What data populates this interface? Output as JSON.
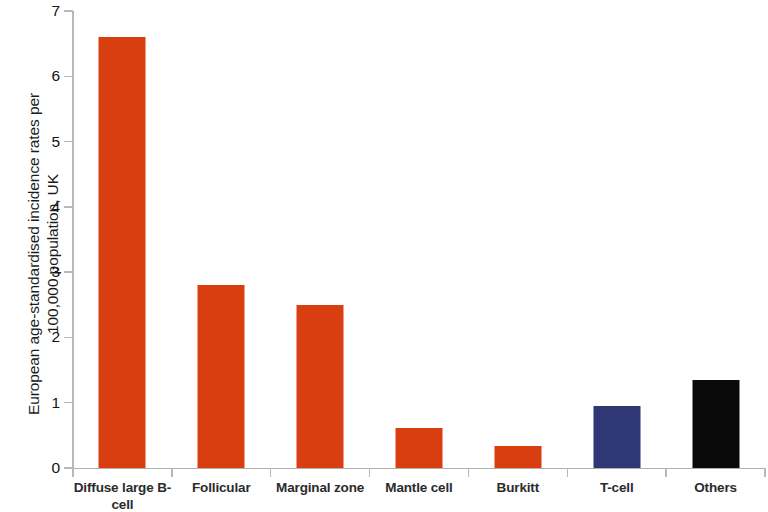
{
  "chart_data": {
    "type": "bar",
    "title": "",
    "subtitle": "",
    "xlabel": "",
    "ylabel": "European age-standardised incidence rates per 100,000 population, UK",
    "ylabel_lines": [
      "European age-standardised incidence rates per",
      "100,000 population, UK"
    ],
    "categories": [
      "Diffuse large B-cell",
      "Follicular",
      "Marginal zone",
      "Mantle cell",
      "Burkitt",
      "T-cell",
      "Others"
    ],
    "category_label_lines": [
      [
        "Diffuse large B-",
        "cell"
      ],
      [
        "Follicular"
      ],
      [
        "Marginal zone"
      ],
      [
        "Mantle cell"
      ],
      [
        "Burkitt"
      ],
      [
        "T-cell"
      ],
      [
        "Others"
      ]
    ],
    "values": [
      6.6,
      2.8,
      2.5,
      0.62,
      0.33,
      0.95,
      1.35
    ],
    "bar_colors": [
      "#d93e11",
      "#d93e11",
      "#d93e11",
      "#d93e11",
      "#d93e11",
      "#2f3775",
      "#0a0a0a"
    ],
    "ylim": [
      0,
      7
    ],
    "ytick_values": [
      0,
      1,
      2,
      3,
      4,
      5,
      6,
      7
    ],
    "ytick_labels": [
      "0",
      "1",
      "2",
      "3",
      "4",
      "5",
      "6",
      "7"
    ],
    "grid": false,
    "legend": null,
    "legend_position": "none",
    "annotations": []
  },
  "colors": {
    "bar_red": "#d93e11",
    "bar_navy": "#2f3775",
    "bar_black": "#0a0a0a",
    "axis": "#b8b8b8",
    "text": "#1c1c1c",
    "background": "#ffffff"
  }
}
